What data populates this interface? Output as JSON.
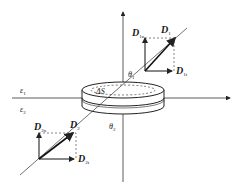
{
  "figure": {
    "medium_labels": {
      "upper": "ε",
      "upper_sub": "1",
      "lower": "ε",
      "lower_sub": "2"
    },
    "surface_label": "ΔS",
    "angles": {
      "upper": "θ",
      "upper_sub": "1",
      "lower": "θ",
      "lower_sub": "2"
    },
    "upper_vectors": {
      "main": "D",
      "main_sub": "1",
      "normal": "D",
      "normal_sub": "1n",
      "tangential": "D",
      "tangential_sub": "1t"
    },
    "lower_vectors": {
      "main": "D",
      "main_sub": "2",
      "normal": "D",
      "normal_sub": "2n",
      "tangential": "D",
      "tangential_sub": "2t"
    },
    "colors": {
      "line": "#333333",
      "background": "#ffffff"
    }
  }
}
